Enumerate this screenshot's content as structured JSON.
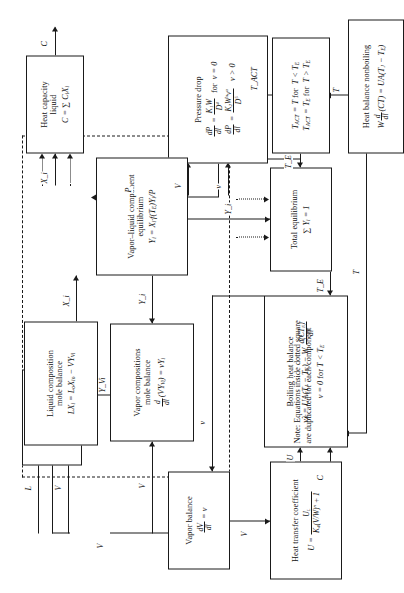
{
  "diagram": {
    "note": "Note: Equations inside dotted square\nare duplicated for each component",
    "rotation_degrees": -90,
    "ink_color": "#1a1a1a",
    "background_color": "#ffffff"
  },
  "boxes": [
    {
      "id": "heat-transfer-coefficient",
      "title": "Heat transfer coefficient",
      "equations": [
        "U = U_L / ( K_4 (V/W)^n + 1 )"
      ]
    },
    {
      "id": "vapor-balance",
      "title": "Vapor balance",
      "equations": [
        "dV/dt = v"
      ]
    },
    {
      "id": "liquid-balance",
      "title": "Liquid balance",
      "equations": [
        "L = L_o − V"
      ]
    },
    {
      "id": "boiling-heat-balance",
      "title": "Boiling heat balance",
      "equations": [
        "vλ = UA(T_J − T_E) − W d(CT_E)/dt",
        "v = 0 for T < T_E"
      ]
    },
    {
      "id": "vapor-compositions-mole-balance",
      "title": "Vapor compositions\nmole balance",
      "equations": [
        "d/dt (V Y_Vi) = v Y_i"
      ]
    },
    {
      "id": "liquid-composition-mole-balance",
      "title": "Liquid composition\nmole balance",
      "equations": [
        "L X_i = L_o X_io − V Y_Vi"
      ]
    },
    {
      "id": "heat-capacity-liquid",
      "title": "Heat capacity\nliquid",
      "equations": [
        "C = ∑ C_i X_i"
      ]
    },
    {
      "id": "pressure-drop",
      "title": "Pressure drop",
      "equations": [
        "dP/dl = K_1 W / D^4   for   v = 0",
        "dP/dl = K_2 W^a v^a / D^5        v > 0"
      ]
    },
    {
      "id": "vapor-liquid-component-equilibrium",
      "title": "Vapor–liquid  component\nequilibrium",
      "equations": [
        "Y_i = X_i · f(T_E) Y_i / P"
      ]
    },
    {
      "id": "total-equilibrium",
      "title": "Total equilibrium",
      "equations": [
        "∑ Y_i = 1"
      ]
    },
    {
      "id": "temperature-selector",
      "title": "",
      "equations": [
        "T_ACT = T for   T < T_E",
        "T_ACT = T_E for   T > T_E"
      ]
    },
    {
      "id": "heat-balance-nonboiling",
      "title": "Heat balance nonboiling",
      "equations": [
        "W d/dt (CT) = UA(T_J − T_E)"
      ]
    }
  ],
  "edge_labels": {
    "u_to_boiling": "U",
    "c_to_boiling": "C",
    "v_out_boiling": "v",
    "v_vapor_out": "V",
    "v_to_liquid_balance": "V",
    "v_to_vapor_comp": "V",
    "v_up_long": "V",
    "l_to_liquid_comp": "L",
    "yvi_up": "Y_Vi",
    "xi_out": "X_i",
    "xi_to_vle": "X_i",
    "yi_to_vapor_comp": "Y_i",
    "yi_down": "Y_i",
    "p_to_vle": "P",
    "te_right": "T_E",
    "te_to_total": "T_E",
    "t_from_nonboiling": "T",
    "t_into_selector": "T",
    "t_act_up": "T_ACT",
    "c_out_heatcap": "C",
    "v_into_pressure": "V",
    "v_small_into_pressure": "v"
  }
}
